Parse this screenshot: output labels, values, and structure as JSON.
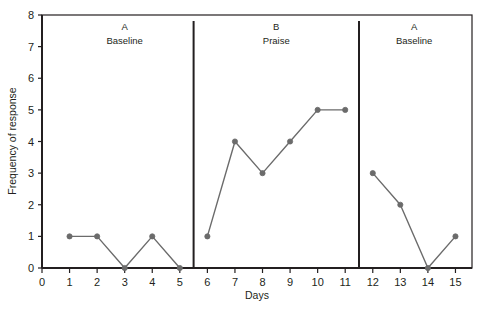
{
  "chart_data": {
    "type": "line",
    "title": "",
    "xlabel": "Days",
    "ylabel": "Frequency of response",
    "xlim": [
      0,
      15.6
    ],
    "ylim": [
      0,
      8
    ],
    "grid": false,
    "legend": "none",
    "x_ticks": [
      "0",
      "1",
      "2",
      "3",
      "4",
      "5",
      "6",
      "7",
      "8",
      "9",
      "10",
      "11",
      "12",
      "13",
      "14",
      "15"
    ],
    "y_ticks": [
      "0",
      "1",
      "2",
      "3",
      "4",
      "5",
      "6",
      "7",
      "8"
    ],
    "x": [
      1,
      2,
      3,
      4,
      5,
      6,
      7,
      8,
      9,
      10,
      11,
      12,
      13,
      14,
      15
    ],
    "values": [
      1,
      1,
      0,
      1,
      0,
      1,
      4,
      3,
      4,
      5,
      5,
      3,
      2,
      0,
      1
    ],
    "series": [
      {
        "name": "A Baseline",
        "phase_letter": "A",
        "phase_name": "Baseline",
        "x": [
          1,
          2,
          3,
          4,
          5
        ],
        "values": [
          1,
          1,
          0,
          1,
          0
        ]
      },
      {
        "name": "B Praise",
        "phase_letter": "B",
        "phase_name": "Praise",
        "x": [
          6,
          7,
          8,
          9,
          10,
          11
        ],
        "values": [
          1,
          4,
          3,
          4,
          5,
          5
        ]
      },
      {
        "name": "A Baseline",
        "phase_letter": "A",
        "phase_name": "Baseline",
        "x": [
          12,
          13,
          14,
          15
        ],
        "values": [
          3,
          2,
          0,
          1
        ]
      }
    ],
    "phase_dividers": [
      5.5,
      11.5
    ],
    "marker_color": "#6b6b6b",
    "line_color": "#6b6b6b",
    "axis_color": "#231f20",
    "plot_background": "#ffffff"
  },
  "phases": [
    {
      "letter": "A",
      "name": "Baseline",
      "center_x": 3.0
    },
    {
      "letter": "B",
      "name": "Praise",
      "center_x": 8.5
    },
    {
      "letter": "A",
      "name": "Baseline",
      "center_x": 13.5
    }
  ],
  "axes": {
    "x_title": "Days",
    "y_title": "Frequency of response"
  }
}
